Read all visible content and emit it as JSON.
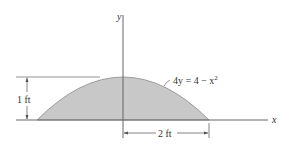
{
  "diagram": {
    "type": "area-under-parabola",
    "axes": {
      "x_label": "x",
      "y_label": "y"
    },
    "curve": {
      "equation_lhs": "4y = 4 − x",
      "equation_exp": "2",
      "equation_full": "4y = 4 − x²"
    },
    "dimensions": {
      "height_label": "1 ft",
      "half_width_label": "2 ft"
    },
    "colors": {
      "fill": "#c8c8c8",
      "stroke": "#555555",
      "axis": "#666666",
      "background": "#ffffff"
    }
  }
}
